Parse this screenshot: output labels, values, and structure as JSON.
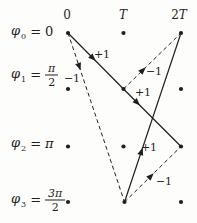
{
  "figure": {
    "type": "phase-trellis-diagram",
    "background": "#fdfdfc",
    "ink": "#1f1f1f",
    "time_axis": [
      {
        "prefix": "0",
        "symbol": "",
        "x": 67
      },
      {
        "prefix": "",
        "symbol": "T",
        "x": 123
      },
      {
        "prefix": "2",
        "symbol": "T",
        "x": 179
      }
    ],
    "phase_labels": [
      {
        "symbol": "φ",
        "sub": "0",
        "eq": "=",
        "value": "0"
      },
      {
        "symbol": "φ",
        "sub": "1",
        "eq": "=",
        "fraction": {
          "num": "π",
          "den": "2"
        }
      },
      {
        "symbol": "φ",
        "sub": "2",
        "eq": "=",
        "value": "π"
      },
      {
        "symbol": "φ",
        "sub": "3",
        "eq": "=",
        "fraction": {
          "num": "3π",
          "den": "2"
        }
      }
    ],
    "trellis": {
      "columns_x": [
        68,
        123.5,
        181
      ],
      "rows_y": [
        33,
        89,
        146.5,
        202
      ],
      "dot_radius": 2.1,
      "dots": [
        [
          68,
          33
        ],
        [
          123.5,
          33
        ],
        [
          181,
          33
        ],
        [
          68,
          89
        ],
        [
          123.5,
          89
        ],
        [
          181,
          89
        ],
        [
          68,
          146.5
        ],
        [
          123.5,
          146.5
        ],
        [
          181,
          146.5
        ],
        [
          68,
          202
        ],
        [
          124.5,
          202
        ],
        [
          181,
          202
        ]
      ],
      "edges": [
        {
          "from": [
            68,
            33
          ],
          "to": [
            123.5,
            89
          ],
          "style": "solid",
          "label": "+1",
          "label_x": 102,
          "label_y": 55,
          "arrow_t": 0.45
        },
        {
          "from": [
            123.5,
            89
          ],
          "to": [
            181,
            146.5
          ],
          "style": "solid",
          "label": "+1",
          "label_x": 143,
          "label_y": 93,
          "arrow_t": 0.24
        },
        {
          "from": [
            124.5,
            202
          ],
          "to": [
            181,
            33
          ],
          "style": "solid",
          "label": "+1",
          "label_x": 149,
          "label_y": 148,
          "arrow_t": 0.3
        },
        {
          "from": [
            68,
            33
          ],
          "to": [
            124.5,
            202
          ],
          "style": "dashed",
          "label": "−1",
          "label_x": 72,
          "label_y": 79,
          "arrow_t": 0.2
        },
        {
          "from": [
            123.5,
            89
          ],
          "to": [
            181,
            33
          ],
          "style": "dashed",
          "label": "−1",
          "label_x": 154,
          "label_y": 72,
          "arrow_t": 0.34
        },
        {
          "from": [
            124.5,
            202
          ],
          "to": [
            181,
            146.5
          ],
          "style": "dashed",
          "label": "−1",
          "label_x": 164,
          "label_y": 182,
          "arrow_t": 0.47
        }
      ]
    }
  }
}
